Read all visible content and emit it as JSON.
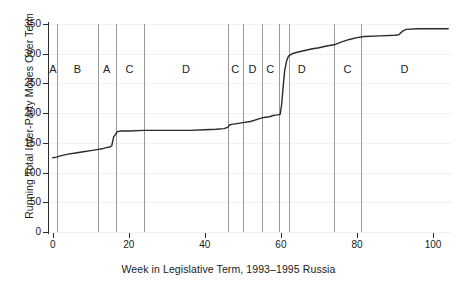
{
  "chart_data": {
    "type": "line",
    "title": "",
    "xlabel": "Week in Legislative Term, 1993–1995 Russia",
    "ylabel": "Running Total Inter-Party Moves Over Term",
    "xlim": [
      -1,
      105
    ],
    "ylim": [
      0,
      350
    ],
    "xticks": [
      0,
      20,
      40,
      60,
      80,
      100
    ],
    "yticks": [
      0,
      50,
      100,
      150,
      200,
      250,
      300,
      350
    ],
    "xticklabels": [
      "0",
      "20",
      "40",
      "60",
      "80",
      "100"
    ],
    "yticklabels": [
      "0",
      "50",
      "100",
      "150",
      "200",
      "250",
      "300",
      "350"
    ],
    "grid": false,
    "legend": "none",
    "series": [
      {
        "name": "Running total inter-party moves",
        "x": [
          0,
          1,
          2,
          4,
          6,
          8,
          10,
          12,
          13,
          14,
          15,
          15.5,
          16,
          17,
          18,
          20,
          24,
          30,
          36,
          40,
          43,
          45,
          46,
          46.5,
          47,
          48,
          50,
          52,
          54,
          55,
          56,
          57,
          58,
          59,
          59.8,
          60.2,
          60.6,
          61,
          61.5,
          62,
          63,
          64,
          66,
          68,
          70,
          72,
          74,
          76,
          78,
          80,
          82,
          86,
          90,
          91,
          92,
          93,
          96,
          100,
          104
        ],
        "y": [
          125,
          126,
          128,
          131,
          133,
          135,
          137,
          139,
          140,
          142,
          143,
          145,
          160,
          169,
          170,
          170,
          171,
          171,
          171,
          172,
          173,
          174,
          176,
          180,
          181,
          182,
          184,
          186,
          190,
          192,
          193,
          194,
          196,
          197,
          198,
          215,
          245,
          272,
          288,
          296,
          300,
          302,
          305,
          308,
          310,
          313,
          315,
          320,
          324,
          327,
          329,
          330,
          331,
          332,
          338,
          341,
          342,
          342,
          342
        ]
      }
    ],
    "vertical_lines": {
      "label": "Legislative session boundaries",
      "weeks": [
        1,
        12,
        16.5,
        24,
        46,
        50,
        55,
        59.5,
        62,
        74,
        81
      ]
    },
    "segment_labels": [
      {
        "label": "A",
        "week": 0.0
      },
      {
        "label": "B",
        "week": 6.5
      },
      {
        "label": "A",
        "week": 14.2
      },
      {
        "label": "C",
        "week": 20.2
      },
      {
        "label": "D",
        "week": 35.0
      },
      {
        "label": "C",
        "week": 48.0
      },
      {
        "label": "D",
        "week": 52.5
      },
      {
        "label": "C",
        "week": 57.2
      },
      {
        "label": "D",
        "week": 65.5
      },
      {
        "label": "C",
        "week": 77.5
      },
      {
        "label": "D",
        "week": 92.5
      }
    ],
    "colors": {
      "line": "#2b2b2b",
      "axis": "#2b2b2b",
      "divider": "#9a9a9a",
      "grid": "#f2f2f2",
      "background": "#ffffff"
    }
  }
}
